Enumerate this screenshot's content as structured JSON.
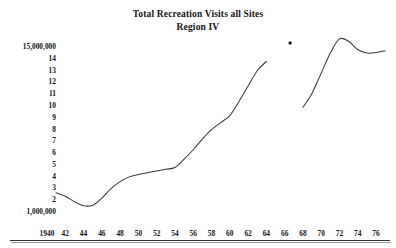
{
  "chart_data": {
    "type": "line",
    "title": "Total Recreation Visits all Sites",
    "subtitle": "Region IV",
    "xlabel": "",
    "ylabel": "",
    "grid": false,
    "legend": "none",
    "xlim": [
      1940,
      1977
    ],
    "ylim": [
      1000000,
      15000000
    ],
    "y_tick_labels": [
      "15,000,000",
      "14",
      "13",
      "12",
      "11",
      "10",
      "9",
      "8",
      "7",
      "6",
      "5",
      "4",
      "3",
      "2",
      "1,000,000"
    ],
    "y_tick_values": [
      15000000,
      14000000,
      13000000,
      12000000,
      11000000,
      10000000,
      9000000,
      8000000,
      7000000,
      6000000,
      5000000,
      4000000,
      3000000,
      2000000,
      1000000
    ],
    "x_tick_labels": [
      "1940",
      "42",
      "44",
      "46",
      "48",
      "50",
      "52",
      "54",
      "56",
      "58",
      "60",
      "62",
      "64",
      "66",
      "68",
      "70",
      "72",
      "74",
      "76"
    ],
    "x_tick_values": [
      1940,
      1942,
      1944,
      1946,
      1948,
      1950,
      1952,
      1954,
      1956,
      1958,
      1960,
      1962,
      1964,
      1966,
      1968,
      1970,
      1972,
      1974,
      1976
    ],
    "series": [
      {
        "name": "Total recreation visits (1941-1964)",
        "x": [
          1941.0,
          1942.0,
          1943.0,
          1944.0,
          1945.0,
          1946.0,
          1947.0,
          1948.0,
          1949.0,
          1950.0,
          1951.0,
          1952.0,
          1953.0,
          1954.0,
          1955.0,
          1956.0,
          1957.0,
          1958.0,
          1959.0,
          1960.0,
          1961.0,
          1962.0,
          1963.0,
          1964.0
        ],
        "y": [
          2550000,
          2250000,
          1800000,
          1450000,
          1500000,
          2100000,
          2900000,
          3500000,
          3900000,
          4100000,
          4250000,
          4400000,
          4550000,
          4700000,
          5400000,
          6200000,
          7100000,
          7900000,
          8500000,
          9100000,
          10300000,
          11600000,
          12900000,
          13700000
        ]
      },
      {
        "name": "Total recreation visits (1968-1977)",
        "x": [
          1968.0,
          1969.0,
          1970.0,
          1971.0,
          1972.0,
          1973.0,
          1974.0,
          1975.0,
          1976.0,
          1977.0
        ],
        "y": [
          9800000,
          11000000,
          12700000,
          14400000,
          15600000,
          15400000,
          14700000,
          14400000,
          14450000,
          14600000
        ]
      }
    ],
    "annotations": [
      {
        "type": "point-marker",
        "x": 1966.6,
        "y": 15250000,
        "label": ""
      }
    ]
  },
  "colors": {
    "line": "#3a3a3a",
    "axis": "#333333",
    "text": "#141414",
    "background": "#ffffff"
  }
}
